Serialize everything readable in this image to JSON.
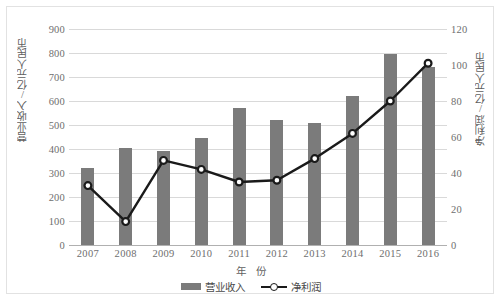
{
  "chart_data": {
    "type": "bar",
    "title": "",
    "xlabel": "年 份",
    "ylabel": "营业收入/亿元人民币",
    "y2label": "净利润/亿元人民币",
    "categories": [
      "2007",
      "2008",
      "2009",
      "2010",
      "2011",
      "2012",
      "2013",
      "2014",
      "2015",
      "2016"
    ],
    "ylim": [
      0,
      900
    ],
    "yticks": [
      "0",
      "100",
      "200",
      "300",
      "400",
      "500",
      "600",
      "700",
      "800",
      "900"
    ],
    "y2lim": [
      0,
      120
    ],
    "y2ticks": [
      "0",
      "20",
      "40",
      "60",
      "80",
      "100",
      "120"
    ],
    "grid": true,
    "legend_position": "bottom",
    "series": [
      {
        "name": "营业收入",
        "type": "bar",
        "axis": "left",
        "color": "#7b7b7b",
        "values": [
          320,
          405,
          390,
          445,
          570,
          520,
          510,
          620,
          795,
          740
        ]
      },
      {
        "name": "净利润",
        "type": "line",
        "axis": "right",
        "color": "#1a1a1a",
        "marker": "circle-open",
        "values": [
          33,
          13,
          47,
          42,
          35,
          36,
          48,
          62,
          80,
          101
        ]
      }
    ]
  },
  "legend": {
    "bar_label": "营业收入",
    "line_label": "净利润"
  }
}
